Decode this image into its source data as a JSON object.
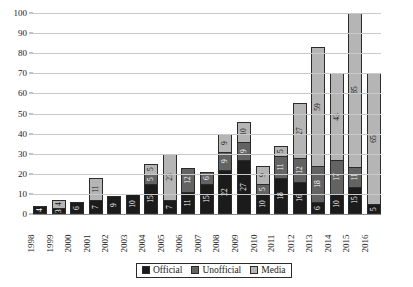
{
  "chart_data": {
    "type": "bar",
    "stacked": true,
    "title": "",
    "xlabel": "",
    "ylabel": "",
    "ylim": [
      0,
      100
    ],
    "yticks": [
      0,
      10,
      20,
      30,
      40,
      50,
      60,
      70,
      80,
      90,
      100
    ],
    "grid": true,
    "legend_position": "bottom",
    "categories": [
      "1998",
      "1999",
      "2000",
      "2001",
      "2002",
      "2003",
      "2004",
      "2005",
      "2006",
      "2007",
      "2008",
      "2009",
      "2010",
      "2011",
      "2012",
      "2013",
      "2014",
      "2015",
      "2016"
    ],
    "series": [
      {
        "name": "Official",
        "color": "#1b1b1b",
        "values": [
          4,
          3,
          6,
          7,
          9,
          10,
          15,
          7,
          11,
          15,
          22,
          27,
          10,
          18,
          16,
          6,
          10,
          15,
          5
        ]
      },
      {
        "name": "Unofficial",
        "color": "#636363",
        "values": [
          0,
          0,
          0,
          0,
          0,
          0,
          5,
          0,
          12,
          6,
          9,
          9,
          5,
          11,
          12,
          18,
          17,
          11,
          0
        ]
      },
      {
        "name": "Media",
        "color": "#b5b5b5",
        "values": [
          0,
          4,
          0,
          11,
          0,
          0,
          5,
          23,
          0,
          0,
          9,
          10,
          9,
          5,
          27,
          59,
          43,
          85,
          65
        ]
      }
    ],
    "labels": {
      "1998": {
        "Official": "4",
        "Unofficial": "",
        "Media": ""
      },
      "1999": {
        "Official": "3",
        "Unofficial": "",
        "Media": "4"
      },
      "2000": {
        "Official": "6",
        "Unofficial": "",
        "Media": ""
      },
      "2001": {
        "Official": "7",
        "Unofficial": "",
        "Media": "11"
      },
      "2002": {
        "Official": "9",
        "Unofficial": "",
        "Media": ""
      },
      "2003": {
        "Official": "10",
        "Unofficial": "",
        "Media": ""
      },
      "2004": {
        "Official": "15",
        "Unofficial": "5",
        "Media": "5"
      },
      "2005": {
        "Official": "7",
        "Unofficial": "",
        "Media": "23"
      },
      "2006": {
        "Official": "11",
        "Unofficial": "12",
        "Media": ""
      },
      "2007": {
        "Official": "15",
        "Unofficial": "6",
        "Media": ""
      },
      "2008": {
        "Official": "22",
        "Unofficial": "9",
        "Media": "9"
      },
      "2009": {
        "Official": "27",
        "Unofficial": "9",
        "Media": "10"
      },
      "2010": {
        "Official": "10",
        "Unofficial": "5",
        "Media": "9"
      },
      "2011": {
        "Official": "18",
        "Unofficial": "11",
        "Media": "5"
      },
      "2012": {
        "Official": "16",
        "Unofficial": "12",
        "Media": "27"
      },
      "2013": {
        "Official": "6",
        "Unofficial": "18",
        "Media": "59"
      },
      "2014": {
        "Official": "10",
        "Unofficial": "17",
        "Media": "43"
      },
      "2015": {
        "Official": "15",
        "Unofficial": "11",
        "Media": "85"
      },
      "2016": {
        "Official": "5",
        "Unofficial": "",
        "Media": "65"
      }
    }
  },
  "legend": {
    "items": [
      {
        "label": "Official",
        "color": "#1b1b1b"
      },
      {
        "label": "Unofficial",
        "color": "#636363"
      },
      {
        "label": "Media",
        "color": "#b5b5b5"
      }
    ]
  }
}
